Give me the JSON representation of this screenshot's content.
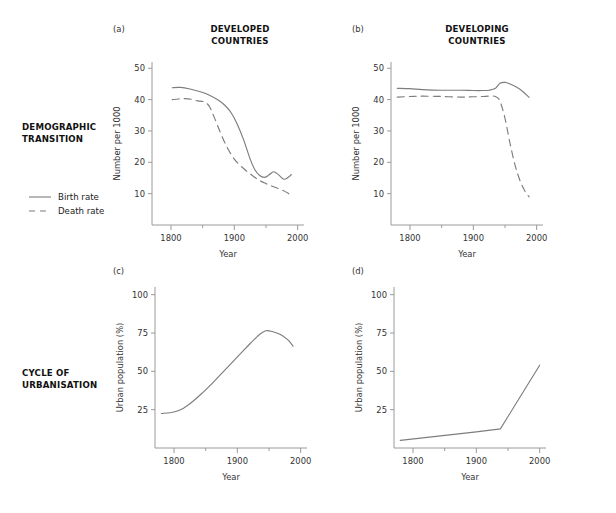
{
  "figure": {
    "width": 616,
    "height": 513,
    "background": "#ffffff",
    "line_color": "#7d7d7d",
    "axis_color": "#9a9a9a",
    "text_color": "#333333"
  },
  "row_labels": [
    {
      "id": "demographic",
      "text": "DEMOGRAPHIC\nTRANSITION"
    },
    {
      "id": "urbanisation",
      "text": "CYCLE OF\nURBANISATION"
    }
  ],
  "column_titles": [
    {
      "id": "developed",
      "text": "DEVELOPED\nCOUNTRIES"
    },
    {
      "id": "developing",
      "text": "DEVELOPING\nCOUNTRIES"
    }
  ],
  "legend": {
    "items": [
      {
        "label": "Birth rate",
        "style": "solid"
      },
      {
        "label": "Death rate",
        "style": "dashed"
      }
    ]
  },
  "panel_tags": {
    "a": "(a)",
    "b": "(b)",
    "c": "(c)",
    "d": "(d)"
  },
  "chart_data": [
    {
      "id": "a",
      "type": "line",
      "panel_tag": "(a)",
      "title": "DEVELOPED COUNTRIES",
      "xlabel": "Year",
      "ylabel": "Number per 1000",
      "xlim": [
        1770,
        2010
      ],
      "ylim": [
        0,
        52
      ],
      "xticks": [
        1800,
        1900,
        2000
      ],
      "xticklabels": [
        "1800",
        "1900",
        "2000"
      ],
      "xminorticks": [
        1850,
        1950
      ],
      "yticks": [
        10,
        20,
        30,
        40,
        50
      ],
      "yticklabels": [
        "10",
        "20",
        "30",
        "40",
        "50"
      ],
      "grid": false,
      "legend_position": "outside-left",
      "series": [
        {
          "name": "Birth rate",
          "style": "solid",
          "x": [
            1802,
            1815,
            1830,
            1845,
            1860,
            1875,
            1885,
            1895,
            1905,
            1915,
            1925,
            1932,
            1940,
            1948,
            1955,
            1962,
            1970,
            1978,
            1985,
            1990
          ],
          "y": [
            43.8,
            43.9,
            43.4,
            42.6,
            41.5,
            39.8,
            38.2,
            35.8,
            32.0,
            27.0,
            21.0,
            17.8,
            15.8,
            15.2,
            16.0,
            17.0,
            16.0,
            14.6,
            15.2,
            16.1
          ]
        },
        {
          "name": "Death rate",
          "style": "dashed",
          "x": [
            1802,
            1812,
            1822,
            1832,
            1842,
            1852,
            1860,
            1868,
            1878,
            1888,
            1900,
            1912,
            1925,
            1938,
            1950,
            1962,
            1975,
            1985,
            1990
          ],
          "y": [
            40.0,
            40.2,
            40.3,
            40.1,
            39.6,
            39.3,
            38.0,
            34.5,
            29.5,
            25.0,
            21.0,
            18.5,
            16.3,
            14.4,
            13.2,
            12.2,
            11.2,
            10.1,
            9.3
          ]
        }
      ]
    },
    {
      "id": "b",
      "type": "line",
      "panel_tag": "(b)",
      "title": "DEVELOPING COUNTRIES",
      "xlabel": "Year",
      "ylabel": "Number per 1000",
      "xlim": [
        1770,
        2010
      ],
      "ylim": [
        0,
        52
      ],
      "xticks": [
        1800,
        1900,
        2000
      ],
      "xticklabels": [
        "1800",
        "1900",
        "2000"
      ],
      "xminorticks": [
        1850,
        1950
      ],
      "yticks": [
        10,
        20,
        30,
        40,
        50
      ],
      "yticklabels": [
        "10",
        "20",
        "30",
        "40",
        "50"
      ],
      "grid": false,
      "series": [
        {
          "name": "Birth rate",
          "style": "solid",
          "x": [
            1780,
            1800,
            1820,
            1850,
            1880,
            1900,
            1915,
            1925,
            1935,
            1942,
            1950,
            1958,
            1968,
            1978,
            1988
          ],
          "y": [
            43.6,
            43.5,
            43.2,
            43.0,
            43.0,
            42.9,
            42.9,
            43.0,
            43.6,
            45.2,
            45.5,
            45.0,
            44.0,
            42.6,
            40.7
          ]
        },
        {
          "name": "Death rate",
          "style": "dashed",
          "x": [
            1780,
            1800,
            1820,
            1850,
            1880,
            1900,
            1915,
            1925,
            1935,
            1942,
            1950,
            1958,
            1966,
            1974,
            1982,
            1988
          ],
          "y": [
            40.8,
            41.0,
            41.1,
            41.0,
            40.8,
            40.9,
            41.0,
            41.1,
            41.0,
            39.5,
            34.0,
            26.0,
            19.0,
            14.0,
            10.6,
            9.0
          ]
        }
      ]
    },
    {
      "id": "c",
      "type": "line",
      "panel_tag": "(c)",
      "title": "",
      "xlabel": "Year",
      "ylabel": "Urban population (%)",
      "xlim": [
        1770,
        2010
      ],
      "ylim": [
        0,
        105
      ],
      "xticks": [
        1800,
        1900,
        2000
      ],
      "xticklabels": [
        "1800",
        "1900",
        "2000"
      ],
      "xminorticks": [
        1850,
        1950
      ],
      "yticks": [
        25,
        50,
        75,
        100
      ],
      "yticklabels": [
        "25",
        "50",
        "75",
        "100"
      ],
      "grid": false,
      "series": [
        {
          "name": "Urban population",
          "style": "solid",
          "x": [
            1780,
            1800,
            1815,
            1830,
            1845,
            1860,
            1875,
            1890,
            1905,
            1920,
            1935,
            1945,
            1955,
            1968,
            1980,
            1988
          ],
          "y": [
            22.5,
            23.5,
            26.0,
            30.5,
            36.0,
            42.0,
            48.5,
            55.0,
            61.5,
            68.0,
            74.0,
            76.5,
            76.0,
            74.0,
            70.5,
            66.5
          ]
        }
      ]
    },
    {
      "id": "d",
      "type": "line",
      "panel_tag": "(d)",
      "title": "",
      "xlabel": "Year",
      "ylabel": "Urban population (%)",
      "xlim": [
        1770,
        2010
      ],
      "ylim": [
        0,
        105
      ],
      "xticks": [
        1800,
        1900,
        2000
      ],
      "xticklabels": [
        "1800",
        "1900",
        "2000"
      ],
      "xminorticks": [
        1850,
        1950
      ],
      "yticks": [
        25,
        50,
        75,
        100
      ],
      "yticklabels": [
        "25",
        "50",
        "75",
        "100"
      ],
      "grid": false,
      "series": [
        {
          "name": "Urban population",
          "style": "solid",
          "x": [
            1780,
            1900,
            1938,
            2000
          ],
          "y": [
            5.0,
            10.5,
            12.5,
            54.0
          ]
        }
      ]
    }
  ]
}
